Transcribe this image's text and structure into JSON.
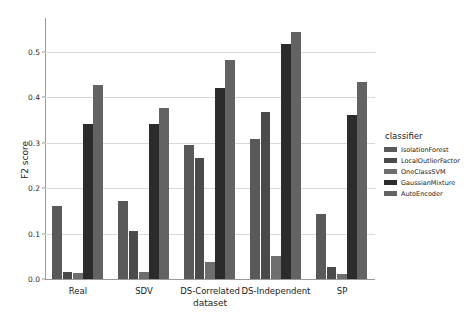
{
  "chart_data": {
    "type": "bar",
    "title": "",
    "xlabel": "dataset",
    "ylabel": "F2 score",
    "categories": [
      "Real",
      "SDV",
      "DS-Correlated",
      "DS-Independent",
      "SP"
    ],
    "series": [
      {
        "name": "IsolationForest",
        "color": "#595959",
        "values": [
          0.16,
          0.171,
          0.296,
          0.308,
          0.144
        ]
      },
      {
        "name": "LocalOutlierFactor",
        "color": "#4a4a4a",
        "values": [
          0.016,
          0.105,
          0.266,
          0.367,
          0.026
        ]
      },
      {
        "name": "OneClassSVM",
        "color": "#6e6e6e",
        "values": [
          0.013,
          0.015,
          0.038,
          0.051,
          0.012
        ]
      },
      {
        "name": "GaussianMixture",
        "color": "#2b2b2b",
        "values": [
          0.341,
          0.342,
          0.421,
          0.518,
          0.362
        ]
      },
      {
        "name": "AutoEncoder",
        "color": "#636363",
        "values": [
          0.428,
          0.377,
          0.482,
          0.544,
          0.434
        ]
      }
    ],
    "ylim": [
      0.0,
      0.575
    ],
    "yticks": [
      "0.0",
      "0.1",
      "0.2",
      "0.3",
      "0.4",
      "0.5"
    ],
    "ytick_values": [
      0.0,
      0.1,
      0.2,
      0.3,
      0.4,
      0.5
    ],
    "grid": true,
    "legend_position": "right",
    "legend_title": "classifier"
  }
}
